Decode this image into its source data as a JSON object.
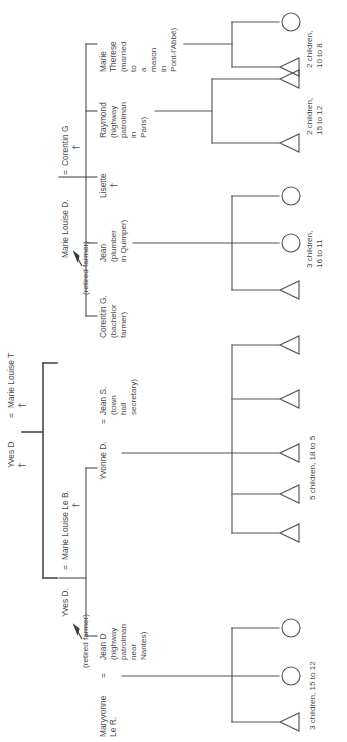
{
  "diagram": {
    "type": "kinship-genealogy-chart",
    "orientation": "rotated-90-ccw",
    "symbols": {
      "male": "triangle",
      "female": "circle",
      "deceased": "†",
      "marriage": "="
    }
  },
  "root": {
    "husband": "Yves D",
    "husband_status": "†",
    "equals": "=",
    "wife": "Marie Louise T",
    "wife_status": "†"
  },
  "branch_a": {
    "label_wife": "Marie Louise D.",
    "equals": "=",
    "label_husband": "Corentin G",
    "husband_status": "†",
    "annotation": "(retired farmer)",
    "children": [
      {
        "name": "Corentin G.",
        "detail_lines": [
          "(bachelor",
          "farmer)"
        ],
        "offspring_label": "",
        "offspring": []
      },
      {
        "name": "Jean",
        "detail_lines": [
          "(plumber",
          "in Quimper)"
        ],
        "offspring_label_lines": [
          "3 children,",
          "16 to 11"
        ],
        "offspring": [
          "male",
          "female",
          "female"
        ]
      },
      {
        "name": "Lisette",
        "status": "†",
        "detail_lines": [],
        "offspring_label": "",
        "offspring": []
      },
      {
        "name": "Raymond",
        "detail_lines": [
          "(highway",
          "patrolman",
          "in",
          "Paris)"
        ],
        "offspring_label_lines": [
          "2 children,",
          "15 to 12"
        ],
        "offspring": [
          "male",
          "male"
        ]
      },
      {
        "name": "Marie",
        "name_line2": "Therese",
        "detail_lines": [
          "(married",
          "to",
          "a",
          "mason",
          "in",
          "Pont-l'Abbé)"
        ],
        "offspring_label_lines": [
          "2 children,",
          "10 to 8"
        ],
        "offspring": [
          "male",
          "female"
        ]
      }
    ]
  },
  "branch_b": {
    "label_husband": "Yves D.",
    "equals": "=",
    "label_wife": "Marie Louise Le B.",
    "wife_status": "†",
    "annotation": "(retired farmer)",
    "children": [
      {
        "name": "Jean D",
        "detail_lines": [
          "(highway",
          "patrolman",
          "near",
          "Nantes)"
        ],
        "spouse_name": "Maryvonne",
        "spouse_equals": "=",
        "spouse_name_line2": "Le R.",
        "offspring_label_lines": [
          "3 children, 15 to 12"
        ],
        "offspring": [
          "male",
          "female",
          "female"
        ]
      },
      {
        "name": "Yvonne D.",
        "equals": "=",
        "spouse": "Jean S.",
        "detail_lines": [
          "(town",
          "hall",
          "secretary)"
        ],
        "offspring_label_lines": [
          "5 children, 18 to 5"
        ],
        "offspring": [
          "male",
          "male",
          "male",
          "male",
          "male"
        ]
      }
    ]
  },
  "colors": {
    "stroke": "#555555",
    "text": "#4a4a4a",
    "background": "#ffffff"
  }
}
